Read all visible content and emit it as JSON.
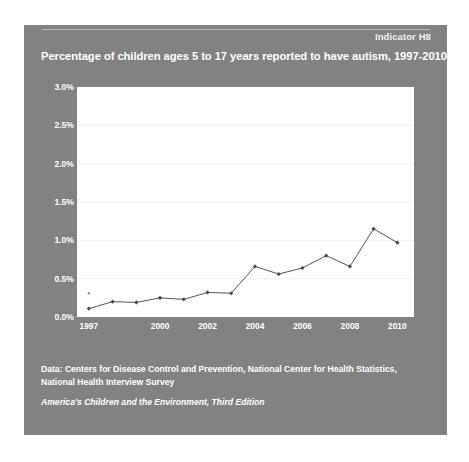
{
  "card": {
    "indicator_tag": "Indicator H8",
    "title": "Percentage of children ages 5 to 17 years reported to have autism, 1997-2010",
    "background_color": "#828282",
    "text_color": "#ffffff"
  },
  "footer": {
    "data_source_line1": "Data: Centers for Disease Control and Prevention, National Center for Health Statistics,",
    "data_source_line2": "National Health Interview Survey",
    "edition": "America's Children and the Environment, Third Edition"
  },
  "chart_data": {
    "type": "line",
    "title": "Percentage of children ages 5 to 17 years reported to have autism, 1997-2010",
    "xlabel": "",
    "ylabel": "",
    "xlim": [
      1996.5,
      2010.7
    ],
    "ylim": [
      0.0,
      3.0
    ],
    "grid": true,
    "legend": null,
    "plot_background": "#ffffff",
    "line_color": "#555555",
    "marker": "diamond",
    "ytick_labels": [
      "3.0%",
      "2.5%",
      "2.0%",
      "1.5%",
      "1.0%",
      "0.5%",
      "0.0%"
    ],
    "ytick_values": [
      3.0,
      2.5,
      2.0,
      1.5,
      1.0,
      0.5,
      0.0
    ],
    "xtick_labels": [
      "1997",
      "2000",
      "2002",
      "2004",
      "2006",
      "2008",
      "2010"
    ],
    "xtick_values": [
      1997,
      2000,
      2002,
      2004,
      2006,
      2008,
      2010
    ],
    "x": [
      1997,
      1998,
      1999,
      2000,
      2001,
      2002,
      2003,
      2004,
      2005,
      2006,
      2007,
      2008,
      2009,
      2010
    ],
    "values": [
      0.11,
      0.2,
      0.19,
      0.25,
      0.23,
      0.32,
      0.31,
      0.66,
      0.56,
      0.64,
      0.8,
      0.66,
      1.15,
      0.97
    ],
    "annotations": [
      {
        "x": 1997,
        "y": 0.26,
        "text": "*",
        "name": "footnote-marker-1997"
      }
    ]
  }
}
